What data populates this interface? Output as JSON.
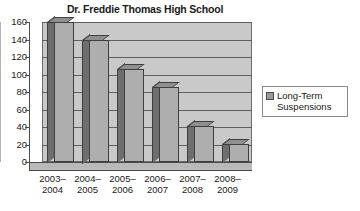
{
  "chart_data": {
    "type": "bar",
    "title": "Dr. Freddie Thomas High School",
    "xlabel": "",
    "ylabel": "",
    "categories": [
      "2003-2004",
      "2004-2005",
      "2005-2006",
      "2006-2007",
      "2007-2008",
      "2008-2009"
    ],
    "category_lines": [
      [
        "2003–",
        "2004"
      ],
      [
        "2004–",
        "2005"
      ],
      [
        "2005–",
        "2006"
      ],
      [
        "2006–",
        "2007"
      ],
      [
        "2007–",
        "2008"
      ],
      [
        "2008–",
        "2009"
      ]
    ],
    "series": [
      {
        "name": "Long-Term Suspensions",
        "values": [
          160,
          140,
          106,
          86,
          41,
          21
        ]
      }
    ],
    "ylim": [
      0,
      160
    ],
    "ytick_step": 20,
    "yticks": [
      0,
      20,
      40,
      60,
      80,
      100,
      120,
      140,
      160
    ],
    "ytick_labels": [
      "0",
      "20",
      "40",
      "60",
      "80",
      "100",
      "120",
      "140",
      "160"
    ],
    "grid": true,
    "legend_position": "right",
    "style": "3d-column",
    "colors": {
      "bar_front": "#aeaeae",
      "bar_side": "#6e6e6e",
      "bar_top": "#8f8f8f",
      "plot_background": "#c9c9c9",
      "wall_side": "#b4b4b4",
      "floor": "#b9b9b9",
      "gridline": "#5f5f5f",
      "axis": "#4a4a4a",
      "text": "#1a1a1a",
      "legend_background": "#ffffff",
      "legend_border": "#8a8a8a",
      "legend_swatch": "#9a9a9a"
    }
  },
  "legend": {
    "entries": [
      {
        "label_line1": "Long-Term",
        "label_line2": "Suspensions"
      }
    ]
  }
}
